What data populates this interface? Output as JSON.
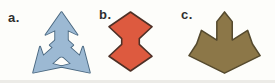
{
  "figure": {
    "background": "#fdfdfa",
    "items": [
      {
        "label": "a.",
        "name": "three-way-arrow",
        "shape": "light-blue three-pronged arrow: one head up, two heads down-left and down-right",
        "fill": "#9cb9d3",
        "stroke": "#4a6880"
      },
      {
        "label": "b.",
        "name": "double-diamond-hourglass",
        "shape": "red-orange hourglass of two pointed diamond lobes joined by a narrow neck",
        "fill": "#dd5a3f",
        "stroke": "#4e3026"
      },
      {
        "label": "c.",
        "name": "leaf-star",
        "shape": "olive-brown leaf-like star: central pointed tower, two side spikes, wide body tapering to a bottom point",
        "fill": "#8c7748",
        "stroke": "#554a2e"
      }
    ]
  }
}
